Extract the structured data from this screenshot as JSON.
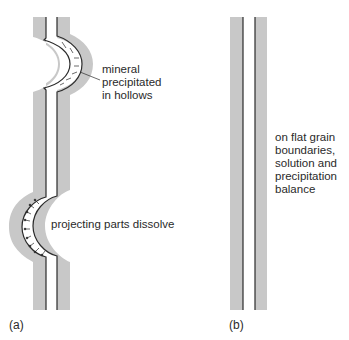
{
  "figure": {
    "panels": [
      {
        "id": "a",
        "label": "(a)",
        "annotations": {
          "top": [
            "mineral",
            "precipitated",
            "in hollows"
          ],
          "bottom": "projecting parts dissolve"
        }
      },
      {
        "id": "b",
        "label": "(b)",
        "annotations": {
          "side": [
            "on flat grain",
            "boundaries,",
            "solution and",
            "precipitation",
            "balance"
          ]
        }
      }
    ],
    "colors": {
      "grain_band": "#c8c8c8",
      "boundary_line": "#2b2b2b",
      "background": "#ffffff",
      "text": "#2a2a2a"
    }
  }
}
